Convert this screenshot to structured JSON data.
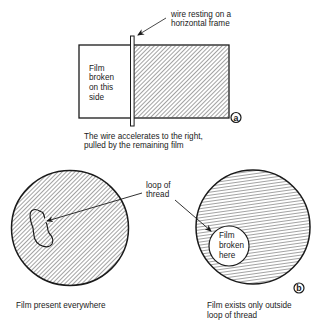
{
  "panel_a": {
    "wire_label": [
      "wire resting on a",
      "horizontal frame"
    ],
    "left_side_label": [
      "Film",
      "broken",
      "on this",
      "side"
    ],
    "caption": [
      "The wire accelerates to the right,",
      "pulled by the remaining film"
    ],
    "panel_marker": "a"
  },
  "panel_b": {
    "thread_label": [
      "loop of",
      "thread"
    ],
    "inner_label": [
      "Film",
      "broken",
      "here"
    ],
    "left_caption": [
      "Film present everywhere"
    ],
    "right_caption": [
      "Film exists only outside",
      "loop of thread"
    ],
    "panel_marker": "b"
  },
  "colors": {
    "ink": "#1a1a1a",
    "background": "#ffffff"
  }
}
